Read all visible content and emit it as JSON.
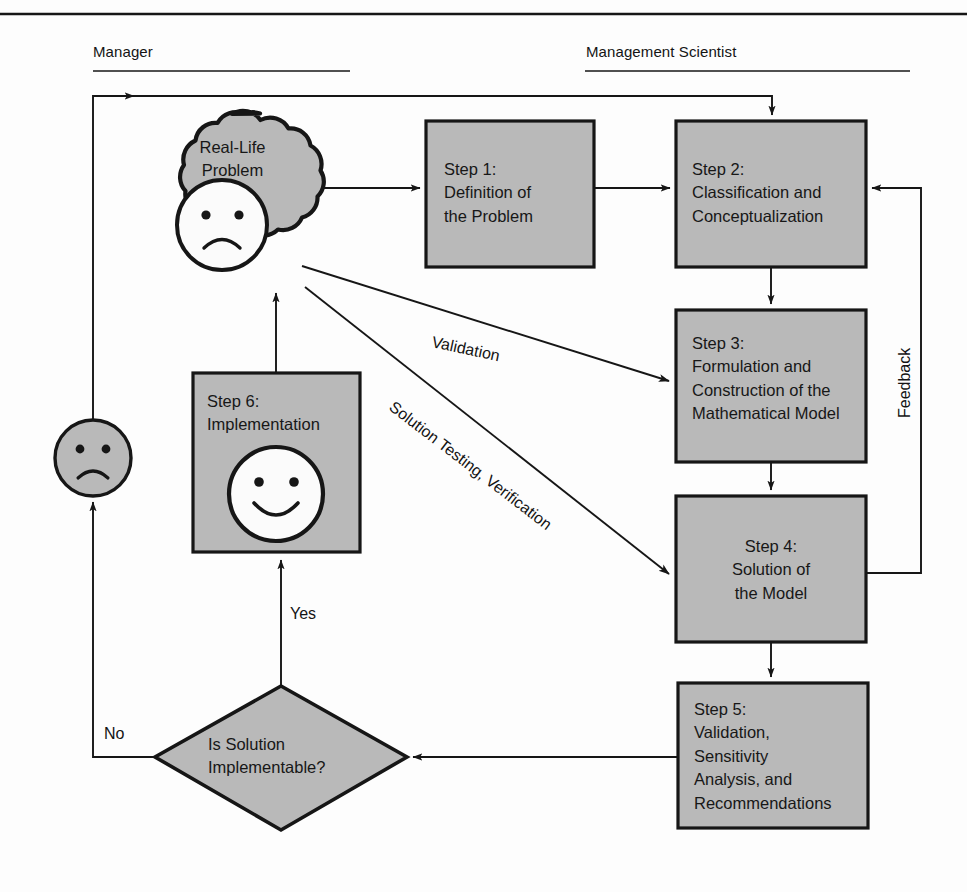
{
  "figure": {
    "type": "flowchart",
    "title_rule": "top-horizontal-rule",
    "swimlanes": [
      {
        "id": "manager",
        "label": "Manager"
      },
      {
        "id": "scientist",
        "label": "Management Scientist"
      }
    ]
  },
  "nodes": {
    "cloud": {
      "label": "Real-Life\nProblem",
      "shape": "cloud",
      "face": "sad"
    },
    "step1": {
      "label": "Step 1:\nDefinition of\nthe Problem",
      "shape": "rect",
      "align": "left"
    },
    "step2": {
      "label": "Step 2:\nClassification and\nConceptualization",
      "shape": "rect",
      "align": "left"
    },
    "step3": {
      "label": "Step 3:\nFormulation and\nConstruction of the\nMathematical Model",
      "shape": "rect",
      "align": "left"
    },
    "step4": {
      "label": "Step 4:\nSolution of\nthe Model",
      "shape": "rect",
      "align": "center"
    },
    "step5": {
      "label": "Step 5:\nValidation,\nSensitivity\nAnalysis, and\nRecommendations",
      "shape": "rect",
      "align": "left"
    },
    "step6": {
      "label": "Step 6:\nImplementation",
      "shape": "rect",
      "align": "left",
      "face": "happy"
    },
    "decision": {
      "label": "Is Solution\nImplementable?",
      "shape": "diamond"
    },
    "manager_face": {
      "shape": "circle",
      "face": "sad"
    }
  },
  "edge_labels": {
    "validation": "Validation",
    "solution_testing": "Solution Testing, Verification",
    "feedback": "Feedback",
    "yes": "Yes",
    "no": "No"
  },
  "colors": {
    "fill_gray": "#b9b9b9",
    "stroke": "#161616",
    "face_fill": "#fbfbfb",
    "background": "#fdfdfd",
    "text": "#171717"
  },
  "icons": {
    "sad_face": "sad-face-icon",
    "happy_face": "happy-face-icon",
    "arrow": "arrow-head-icon"
  }
}
